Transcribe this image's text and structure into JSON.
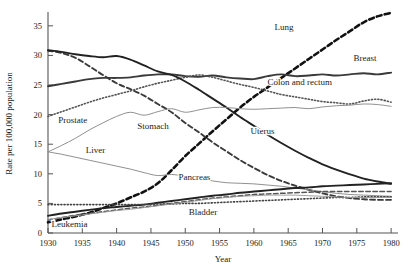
{
  "chart_data": {
    "type": "line",
    "title": "",
    "xlabel": "Year",
    "ylabel": "Rate per 100,000 population",
    "xlim": [
      1930,
      1981
    ],
    "ylim": [
      0,
      37
    ],
    "xticks": [
      1930,
      1935,
      1940,
      1945,
      1950,
      1955,
      1960,
      1965,
      1970,
      1975,
      1980
    ],
    "yticks": [
      0,
      5,
      10,
      15,
      20,
      25,
      30,
      35
    ],
    "grid": false,
    "legend": "inline-labels",
    "x": [
      1930,
      1932,
      1934,
      1936,
      1938,
      1940,
      1942,
      1944,
      1946,
      1948,
      1950,
      1952,
      1954,
      1956,
      1958,
      1960,
      1962,
      1964,
      1966,
      1968,
      1970,
      1972,
      1974,
      1976,
      1978,
      1980
    ],
    "series": [
      {
        "name": "Lung",
        "label": "Lung",
        "style": "heavy-dashed",
        "color": "#111111",
        "values": [
          1.8,
          2.3,
          2.8,
          3.4,
          4.2,
          5.0,
          6.0,
          7.0,
          8.4,
          10.6,
          13.0,
          15.1,
          17.2,
          19.2,
          21.2,
          23.0,
          24.6,
          26.2,
          27.8,
          29.4,
          31.0,
          32.6,
          34.1,
          35.6,
          36.6,
          37.2
        ]
      },
      {
        "name": "Stomach",
        "label": "Stomach",
        "style": "dashed",
        "color": "#3a3a3a",
        "values": [
          30.8,
          30.4,
          29.6,
          28.2,
          26.7,
          25.3,
          24.3,
          23.2,
          21.8,
          20.4,
          18.6,
          17.0,
          15.3,
          13.8,
          12.3,
          11.0,
          9.8,
          8.8,
          8.0,
          7.3,
          6.7,
          6.2,
          5.9,
          5.7,
          5.6,
          5.6
        ]
      },
      {
        "name": "Breast",
        "label": "Breast",
        "style": "solid-heavy",
        "color": "#3a3a3a",
        "values": [
          24.8,
          25.2,
          25.6,
          26.0,
          26.2,
          26.2,
          26.3,
          26.6,
          26.8,
          26.8,
          26.5,
          26.4,
          26.6,
          26.3,
          26.1,
          26.0,
          26.5,
          26.8,
          26.5,
          26.6,
          26.8,
          26.6,
          26.8,
          27.0,
          26.8,
          27.1
        ]
      },
      {
        "name": "Colon and rectum",
        "label": "Colon and rectum",
        "style": "dotted",
        "color": "#555555",
        "values": [
          19.7,
          20.5,
          21.3,
          22.1,
          22.8,
          23.4,
          24.0,
          24.7,
          25.3,
          25.8,
          26.3,
          26.7,
          26.3,
          25.7,
          25.1,
          24.6,
          24.0,
          23.4,
          23.0,
          22.6,
          22.2,
          22.0,
          21.8,
          22.3,
          22.6,
          22.1
        ]
      },
      {
        "name": "Uterus",
        "label": "Uterus",
        "style": "solid-heavy",
        "color": "#222222",
        "values": [
          30.9,
          30.6,
          30.2,
          29.9,
          29.7,
          29.9,
          29.3,
          28.3,
          27.3,
          26.7,
          25.6,
          24.2,
          22.7,
          21.2,
          19.6,
          18.1,
          16.6,
          15.2,
          13.9,
          12.7,
          11.6,
          10.7,
          9.9,
          9.2,
          8.7,
          8.3
        ]
      },
      {
        "name": "Prostate",
        "label": "Prostate",
        "style": "thin-gray",
        "color": "#8a8a8a",
        "values": [
          13.7,
          14.8,
          16.0,
          17.4,
          18.6,
          19.7,
          20.4,
          19.9,
          20.5,
          21.0,
          20.4,
          20.8,
          21.2,
          21.2,
          21.0,
          20.9,
          21.0,
          21.1,
          21.2,
          21.0,
          21.3,
          21.5,
          21.6,
          21.8,
          21.7,
          21.4
        ]
      },
      {
        "name": "Liver",
        "label": "Liver",
        "style": "thin-gray",
        "color": "#8a8a8a",
        "values": [
          13.7,
          13.3,
          12.8,
          12.3,
          11.8,
          11.3,
          10.8,
          10.2,
          9.7,
          9.9,
          9.6,
          9.2,
          8.8,
          8.5,
          8.4,
          8.3,
          8.1,
          7.9,
          7.6,
          7.3,
          7.0,
          6.7,
          6.5,
          6.4,
          6.3,
          6.2
        ]
      },
      {
        "name": "Pancreas",
        "label": "Pancreas",
        "style": "solid-heavy",
        "color": "#222222",
        "values": [
          2.9,
          3.3,
          3.6,
          3.9,
          4.2,
          4.4,
          4.6,
          4.8,
          5.1,
          5.4,
          5.7,
          6.0,
          6.3,
          6.5,
          6.8,
          7.0,
          7.2,
          7.4,
          7.6,
          7.7,
          7.9,
          8.0,
          8.1,
          8.2,
          8.3,
          8.4
        ]
      },
      {
        "name": "Leukemia",
        "label": "Leukemia",
        "style": "dashed-medium",
        "color": "#555555",
        "values": [
          2.2,
          2.6,
          3.0,
          3.3,
          3.6,
          3.9,
          4.2,
          4.4,
          4.7,
          5.0,
          5.3,
          5.6,
          5.9,
          6.1,
          6.3,
          6.5,
          6.6,
          6.7,
          6.8,
          6.9,
          7.0,
          7.0,
          7.0,
          7.0,
          7.0,
          7.0
        ]
      },
      {
        "name": "Bladder",
        "label": "Bladder",
        "style": "dotted",
        "color": "#444444",
        "values": [
          4.8,
          4.8,
          4.8,
          4.8,
          4.8,
          4.8,
          4.8,
          4.8,
          4.9,
          4.9,
          5.0,
          5.0,
          5.1,
          5.2,
          5.3,
          5.4,
          5.5,
          5.6,
          5.7,
          5.8,
          5.9,
          6.0,
          6.0,
          6.1,
          6.1,
          6.1
        ]
      },
      {
        "name": "Other-gray-lower",
        "label": "",
        "style": "thin-gray",
        "color": "#9a9a9a",
        "values": [
          2.3,
          2.6,
          2.9,
          3.2,
          3.5,
          3.8,
          4.0,
          4.3,
          4.6,
          4.9,
          5.2,
          5.5,
          5.8,
          6.0,
          6.2,
          6.3,
          6.4,
          6.4,
          6.4,
          6.3,
          6.2,
          6.1,
          6.0,
          6.0,
          6.0,
          6.0
        ]
      }
    ],
    "annotations": [
      {
        "text": "Lung",
        "x": 1963.0,
        "y": 34.3
      },
      {
        "text": "Breast",
        "x": 1974.5,
        "y": 29.0
      },
      {
        "text": "Colon and rectum",
        "x": 1962.0,
        "y": 25.0
      },
      {
        "text": "Uterus",
        "x": 1959.5,
        "y": 16.8
      },
      {
        "text": "Stomach",
        "x": 1943.0,
        "y": 17.5
      },
      {
        "text": "Prostate",
        "x": 1931.5,
        "y": 18.6
      },
      {
        "text": "Liver",
        "x": 1935.5,
        "y": 13.5
      },
      {
        "text": "Pancreas",
        "x": 1949.0,
        "y": 9.0
      },
      {
        "text": "Bladder",
        "x": 1950.5,
        "y": 3.0
      },
      {
        "text": "Leukemia",
        "x": 1930.5,
        "y": 1.0
      }
    ]
  },
  "axis": {
    "y_title": "Rate per 100,000 population",
    "x_title": "Year",
    "ytick_labels": [
      "0",
      "5",
      "10",
      "15",
      "20",
      "25",
      "30",
      "35"
    ],
    "xtick_labels": [
      "1930",
      "1935",
      "1940",
      "1945",
      "1950",
      "1955",
      "1960",
      "1965",
      "1970",
      "1975",
      "1980"
    ]
  }
}
